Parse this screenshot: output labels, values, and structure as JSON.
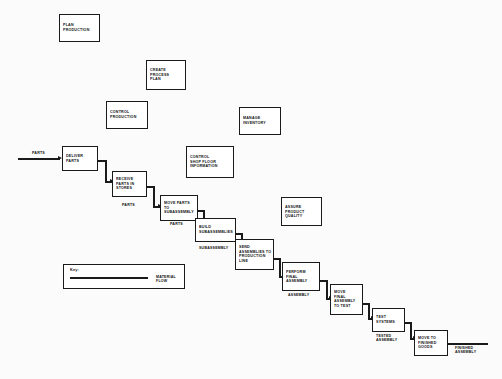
{
  "diagram": {
    "background_color": "#fbfbfb",
    "line_color": "#1a1a1a",
    "box_fill": "#ffffff"
  },
  "control_boxes": [
    {
      "id": "plan-production",
      "label": "PLAN\nPRODUCTION"
    },
    {
      "id": "create-process-plan",
      "label": "CREATE\nPROCESS\nPLAN"
    },
    {
      "id": "control-production",
      "label": "CONTROL\nPRODUCTION"
    },
    {
      "id": "manage-inventory",
      "label": "MANAGE\nINVENTORY"
    },
    {
      "id": "control-shop-floor-information",
      "label": "CONTROL\nSHOP FLOOR\nINFORMATION"
    },
    {
      "id": "assure-product-quality",
      "label": "ASSURE\nPRODUCT\nQUALITY"
    }
  ],
  "process_boxes": [
    {
      "id": "deliver-parts",
      "label": "DELIVER\nPARTS"
    },
    {
      "id": "receive-parts-in-stores",
      "label": "RECEIVE\nPARTS IN\nSTORES"
    },
    {
      "id": "move-parts-to-subassembly",
      "label": "MOVE PARTS\nTO\nSUBASSEMBLY"
    },
    {
      "id": "build-subassemblies",
      "label": "BUILD\nSUBASSEMBLIES"
    },
    {
      "id": "send-assemblies-to-production-line",
      "label": "SEND\nASSEMBLIES TO\nPRODUCTION\nLINE"
    },
    {
      "id": "perform-final-assembly",
      "label": "PERFORM\nFINAL\nASSEMBLY"
    },
    {
      "id": "move-final-assembly-to-test",
      "label": "MOVE\nFINAL\nASSEMBLY\nTO TEST"
    },
    {
      "id": "test-systems",
      "label": "TEST\nSYSTEMS"
    },
    {
      "id": "move-to-finished-goods",
      "label": "MOVE TO\nFINISHED\nGOODS"
    }
  ],
  "flow_labels": [
    {
      "id": "parts-input",
      "label": "PARTS"
    },
    {
      "id": "parts-received",
      "label": "PARTS"
    },
    {
      "id": "parts-moved",
      "label": "PARTS"
    },
    {
      "id": "subassembly",
      "label": "SUBASSEMBLY"
    },
    {
      "id": "assembly",
      "label": "ASSEMBLY"
    },
    {
      "id": "tested-assembly",
      "label": "TESTED\nASSEMBLY"
    },
    {
      "id": "finished-assembly",
      "label": "FINISHED\nASSEMBLY"
    }
  ],
  "legend": {
    "title": "Key:",
    "flow_label": "MATERIAL FLOW"
  }
}
